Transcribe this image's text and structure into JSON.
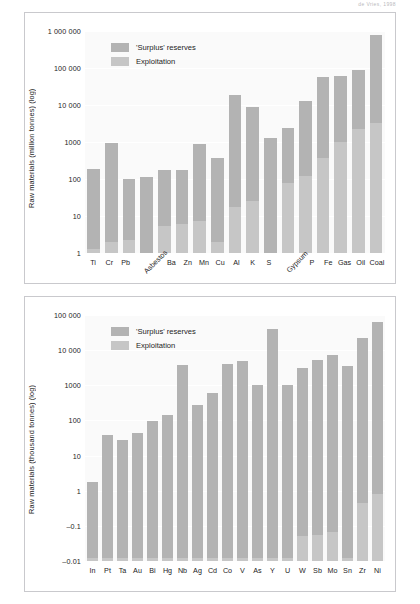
{
  "page": {
    "running_head": "de Vries, 1998"
  },
  "chart_data": [
    {
      "id": "top",
      "type": "bar",
      "title": "",
      "xlabel": "",
      "ylabel": "Raw materials (million tonnes) (log)",
      "scale": "log",
      "ylim": [
        1,
        1000000
      ],
      "ticks": [
        "1 000 000",
        "100 000",
        "10 000",
        "1000",
        "100",
        "10",
        "1"
      ],
      "tick_values": [
        1000000,
        100000,
        10000,
        1000,
        100,
        10,
        1
      ],
      "grid": true,
      "legend_position": "top-left",
      "legend": [
        "'Surplus' reserves",
        "Exploitation"
      ],
      "categories": [
        "Ti",
        "Cr",
        "Pb",
        "Asbestos",
        "Ba",
        "Zn",
        "Mn",
        "Cu",
        "Al",
        "K",
        "S",
        "Gypsum",
        "P",
        "Fe",
        "Gas",
        "Oil",
        "Coal"
      ],
      "rotated_categories": [
        "Asbestos",
        "Gypsum"
      ],
      "series": [
        {
          "name": "Exploitation",
          "values": [
            1.3,
            2.0,
            2.3,
            1.0,
            5.5,
            6.0,
            7.5,
            2.0,
            17,
            25,
            1.0,
            80,
            120,
            380,
            1000,
            2300,
            3300
          ]
        },
        {
          "name": "'Surplus' reserves",
          "values": [
            190,
            950,
            98,
            115,
            175,
            175,
            880,
            360,
            19000,
            9000,
            1250,
            2400,
            13000,
            58000,
            62000,
            88000,
            780000
          ]
        }
      ]
    },
    {
      "id": "bottom",
      "type": "bar",
      "title": "",
      "xlabel": "",
      "ylabel": "Raw materials (thousand tonnes) (log)",
      "scale": "log",
      "ylim": [
        0.01,
        100000
      ],
      "ticks": [
        "100 000",
        "10 000",
        "1000",
        "100",
        "10",
        "1",
        "–0.1",
        "–0.01"
      ],
      "tick_values": [
        100000,
        10000,
        1000,
        100,
        10,
        1,
        0.1,
        0.01
      ],
      "grid": true,
      "legend_position": "top-left",
      "legend": [
        "'Surplus' reserves",
        "Exploitation"
      ],
      "categories": [
        "In",
        "Pt",
        "Ta",
        "Au",
        "Bi",
        "Hg",
        "Nb",
        "Ag",
        "Cd",
        "Co",
        "V",
        "As",
        "Y",
        "U",
        "W",
        "Sb",
        "Mo",
        "Sn",
        "Zr",
        "Ni"
      ],
      "rotated_categories": [],
      "series": [
        {
          "name": "Exploitation",
          "values": [
            0.012,
            0.012,
            0.012,
            0.012,
            0.012,
            0.012,
            0.012,
            0.012,
            0.012,
            0.012,
            0.012,
            0.012,
            0.012,
            0.012,
            0.05,
            0.055,
            0.065,
            0.012,
            0.45,
            0.8
          ]
        },
        {
          "name": "'Surplus' reserves",
          "values": [
            1.8,
            38,
            28,
            45,
            95,
            140,
            3800,
            270,
            620,
            4000,
            4900,
            1050,
            40000,
            1050,
            3100,
            5400,
            7100,
            3500,
            22000,
            65000
          ]
        }
      ]
    }
  ]
}
